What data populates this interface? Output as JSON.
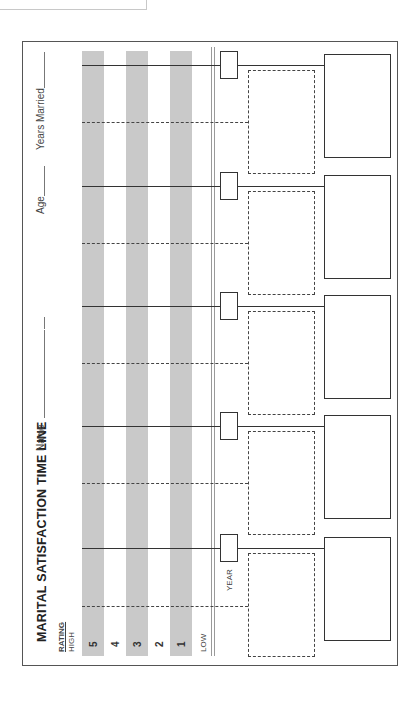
{
  "form": {
    "title": "MARITAL SATISFACTION TIME LINE",
    "fields": {
      "name_label": "Name",
      "age_label": "Age",
      "years_married_label": "Years Married"
    },
    "rating": {
      "header": "RATING",
      "high_label": "HIGH",
      "low_label": "LOW",
      "levels": [
        "5",
        "4",
        "3",
        "2",
        "1"
      ]
    },
    "year_label": "YEAR",
    "timeline_markers": 5,
    "colors": {
      "band": "#c9c9c9",
      "line": "#333333",
      "frame": "#555555"
    }
  }
}
